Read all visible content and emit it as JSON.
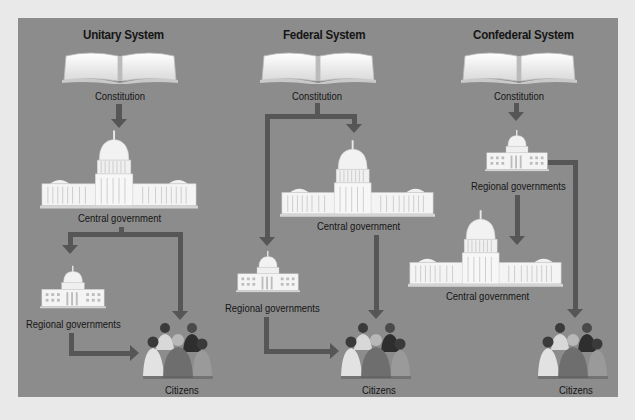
{
  "diagram": {
    "background_color": "#e9e9e9",
    "panel_color": "#8c8c8c",
    "arrow_color": "#565656",
    "columns": [
      {
        "title": "Unitary System",
        "nodes": {
          "constitution": "Constitution",
          "central": "Central government",
          "regional": "Regional governments",
          "citizens": "Citizens"
        },
        "flow": [
          "Constitution -> Central government",
          "Central government -> Regional governments",
          "Central government -> Citizens",
          "Regional governments -> Citizens"
        ]
      },
      {
        "title": "Federal System",
        "nodes": {
          "constitution": "Constitution",
          "central": "Central government",
          "regional": "Regional governments",
          "citizens": "Citizens"
        },
        "flow": [
          "Constitution -> Central government",
          "Constitution -> Regional governments",
          "Central government -> Citizens",
          "Regional governments -> Citizens"
        ]
      },
      {
        "title": "Confederal System",
        "nodes": {
          "constitution": "Constitution",
          "regional": "Regional governments",
          "central": "Central government",
          "citizens": "Citizens"
        },
        "flow": [
          "Constitution -> Regional governments",
          "Regional governments -> Central government",
          "Regional governments -> Citizens"
        ]
      }
    ],
    "icons": {
      "constitution": "open-book-icon",
      "government": "capitol-building-icon",
      "citizens": "people-group-icon"
    }
  }
}
